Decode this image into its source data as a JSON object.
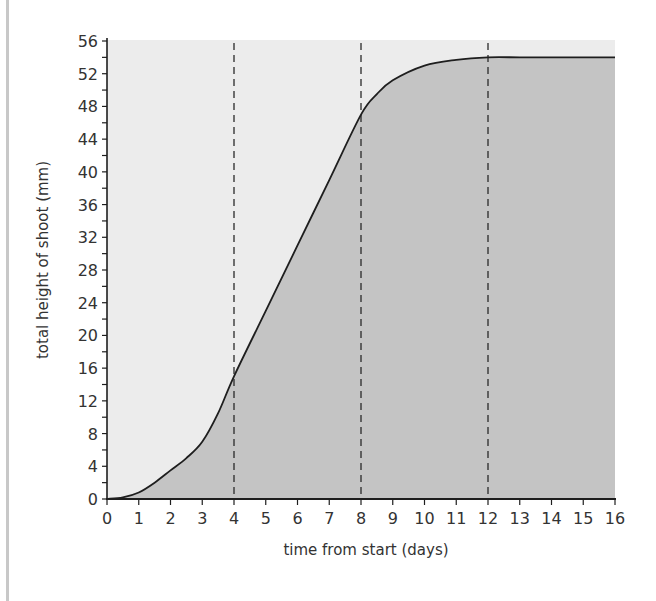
{
  "chart_data": {
    "type": "area",
    "title": "",
    "xlabel": "time from start (days)",
    "ylabel": "total height of shoot (mm)",
    "xlim": [
      0,
      16
    ],
    "ylim": [
      0,
      56
    ],
    "x_ticks": [
      0,
      1,
      2,
      3,
      4,
      5,
      6,
      7,
      8,
      9,
      10,
      11,
      12,
      13,
      14,
      15,
      16
    ],
    "y_ticks": [
      0,
      4,
      8,
      12,
      16,
      20,
      24,
      28,
      32,
      36,
      40,
      44,
      48,
      52,
      56
    ],
    "grid": false,
    "legend": null,
    "series": [
      {
        "name": "total height of shoot",
        "x": [
          0,
          0.5,
          1,
          1.5,
          2,
          2.5,
          3,
          3.5,
          4,
          5,
          6,
          7,
          8,
          8.5,
          9,
          10,
          11,
          12,
          13,
          14,
          15,
          16
        ],
        "values": [
          0,
          0.2,
          0.8,
          2,
          3.5,
          5,
          7,
          10.5,
          15,
          23,
          31,
          39,
          47,
          49.5,
          51.2,
          53,
          53.7,
          54,
          54,
          54,
          54,
          54
        ]
      }
    ],
    "annotations": {
      "dashed_vertical_lines_at_day": [
        4,
        8,
        12
      ]
    },
    "colors": {
      "plot_background": "#ececec",
      "area_fill": "#c4c4c4",
      "curve": "#1e1e1e",
      "axis": "#1e1e1e"
    }
  }
}
